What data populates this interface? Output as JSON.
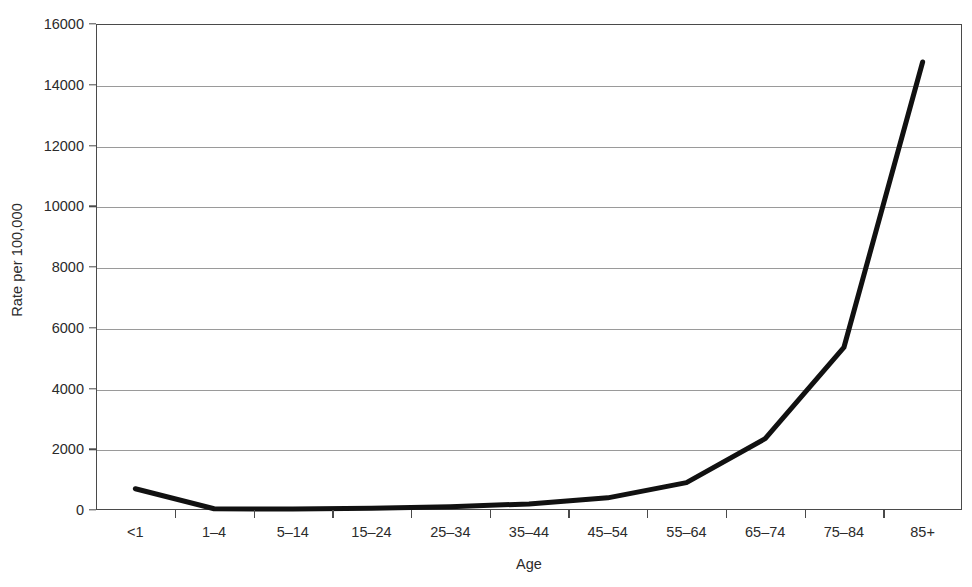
{
  "chart_data": {
    "type": "line",
    "title": "",
    "xlabel": "Age",
    "ylabel": "Rate per 100,000",
    "categories": [
      "<1",
      "1–4",
      "5–14",
      "15–24",
      "25–34",
      "35–44",
      "45–54",
      "55–64",
      "65–74",
      "75–84",
      "85+"
    ],
    "values": [
      700,
      40,
      30,
      60,
      110,
      200,
      400,
      900,
      2350,
      5350,
      14750
    ],
    "series": [
      {
        "name": "Rate per 100,000",
        "values": [
          700,
          40,
          30,
          60,
          110,
          200,
          400,
          900,
          2350,
          5350,
          14750
        ]
      }
    ],
    "ylim": [
      0,
      16000
    ],
    "y_ticks": [
      0,
      2000,
      4000,
      6000,
      8000,
      10000,
      12000,
      14000,
      16000
    ],
    "y_tick_labels": [
      "0",
      "2000",
      "4000",
      "6000",
      "8000",
      "10000",
      "12000",
      "14000",
      "16000"
    ],
    "grid": true,
    "grid_axis": "y",
    "legend": false,
    "legend_position": "none",
    "line_color": "#111111",
    "grid_color": "#9a9a9a",
    "axis_color": "#4a4a4a",
    "background_color": "#ffffff"
  }
}
